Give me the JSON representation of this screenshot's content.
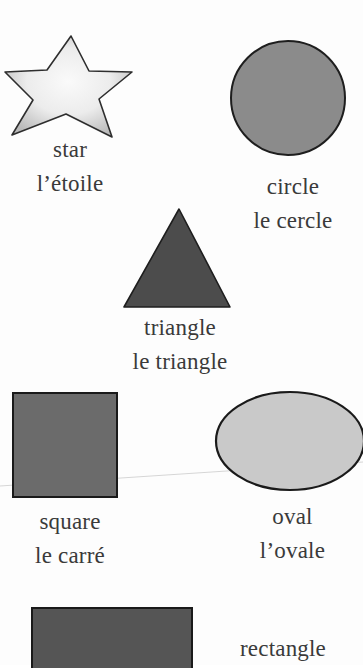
{
  "page": {
    "background": "#fdfdfd",
    "text_color": "#3a3a3a"
  },
  "shapes": {
    "star": {
      "english": "star",
      "french": "l’étoile",
      "fill": "#ececec",
      "stroke": "#2e2e2e"
    },
    "circle": {
      "english": "circle",
      "french": "le cercle",
      "fill": "#8b8b8b",
      "stroke": "#1e1e1e"
    },
    "triangle": {
      "english": "triangle",
      "french": "le triangle",
      "fill": "#4c4c4c",
      "stroke": "#1e1e1e"
    },
    "square": {
      "english": "square",
      "french": "le carré",
      "fill": "#6b6b6b",
      "stroke": "#1a1a1a"
    },
    "oval": {
      "english": "oval",
      "french": "l’ovale",
      "fill": "#c9c9c9",
      "stroke": "#1a1a1a"
    },
    "rectangle": {
      "english": "rectangle",
      "french": "",
      "fill": "#555555",
      "stroke": "#1a1a1a"
    }
  }
}
